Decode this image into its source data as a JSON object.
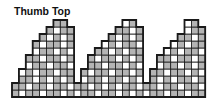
{
  "title": "Thumb Top",
  "colors": {
    "shaded": "#b4b4b4",
    "unshaded": "#ffffff",
    "grid_line": "#1a1a1a"
  },
  "grid": {
    "origin_x": 12,
    "origin_y": 20,
    "cell_w": 6.9,
    "cell_h": 7,
    "rows": 11,
    "cols": 28,
    "column_heights": [
      2,
      4,
      6,
      8,
      9,
      10,
      11,
      11,
      10,
      2,
      4,
      6,
      7,
      8,
      9,
      10,
      11,
      11,
      10,
      2,
      4,
      6,
      7,
      8,
      9,
      11,
      11,
      10
    ],
    "shaded_rows": [
      "0110101101101101011011011010",
      "1011010110110101101011011011",
      "0101101011010110101101101101",
      "1101011011011010110101101011",
      "0110110101101101011011010110",
      "1011011010110110101101101101",
      "0101101101011011010110110101",
      "1010110110101101101011011010",
      "0110101011011011010110101101",
      "1101101101101010110110110110",
      "1011011010110110101011011011"
    ]
  }
}
